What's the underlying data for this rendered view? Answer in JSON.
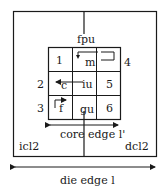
{
  "diagram": {
    "die_label": "die edge l",
    "core_label": "core edge l'",
    "units": {
      "fpu": "fpu",
      "icl2": "icl2",
      "dcl2": "dcl2"
    },
    "grid": {
      "rows": [
        [
          "1",
          "m",
          ""
        ],
        [
          "c",
          "iu",
          "5"
        ],
        [
          "f",
          "gu",
          "6"
        ]
      ]
    },
    "side_numbers": {
      "n2": "2",
      "n3": "3",
      "n4": "4"
    },
    "colors": {
      "line": "#1a1a1a",
      "background": "#ffffff"
    }
  }
}
